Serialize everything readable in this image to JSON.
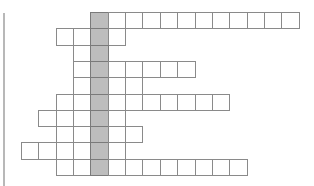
{
  "puzzle": {
    "type": "crossword-acrostic-grid",
    "origin_x": 21,
    "origin_y": 12,
    "cell_w": 17.35,
    "cell_h": 16.3,
    "key_column": 4,
    "colors": {
      "border": "#8a8a8a",
      "cell": "#ffffff",
      "key": "#bdbdbd",
      "left_bar": "#b8b8b8"
    },
    "rows": [
      {
        "start": 4,
        "end": 15
      },
      {
        "start": 2,
        "end": 5
      },
      {
        "start": 3,
        "end": 4
      },
      {
        "start": 3,
        "end": 9
      },
      {
        "start": 3,
        "end": 6
      },
      {
        "start": 2,
        "end": 11
      },
      {
        "start": 1,
        "end": 5
      },
      {
        "start": 2,
        "end": 6
      },
      {
        "start": 0,
        "end": 5
      },
      {
        "start": 2,
        "end": 12
      }
    ]
  }
}
